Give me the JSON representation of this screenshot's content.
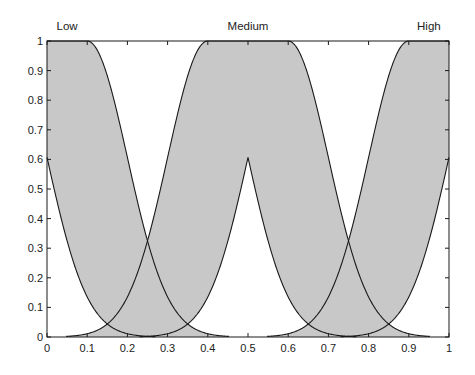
{
  "chart_data": {
    "type": "area",
    "title": "",
    "xlabel": "",
    "ylabel": "",
    "xlim": [
      0,
      1
    ],
    "ylim": [
      0,
      1
    ],
    "grid": false,
    "legend": null,
    "x_ticks": [
      "0",
      "0.1",
      "0.2",
      "0.3",
      "0.4",
      "0.5",
      "0.6",
      "0.7",
      "0.8",
      "0.9",
      "1"
    ],
    "y_ticks": [
      "0",
      "0.1",
      "0.2",
      "0.3",
      "0.4",
      "0.5",
      "0.6",
      "0.7",
      "0.8",
      "0.9",
      "1"
    ],
    "annotations": [
      {
        "text": "Low",
        "x": 0.05
      },
      {
        "text": "Medium",
        "x": 0.5
      },
      {
        "text": "High",
        "x": 0.95
      }
    ],
    "fill_color": "#c8c8c8",
    "line_color": "#1a1a1a",
    "series": [
      {
        "name": "Low",
        "sigma": 0.1,
        "mean_range": [
          -0.1,
          0.1
        ],
        "upper_peak": 1.0,
        "lower_peak_at_center": 0.61,
        "x": [
          0,
          0.05,
          0.1,
          0.15,
          0.2,
          0.25,
          0.3,
          0.35,
          0.4,
          0.45,
          0.5
        ],
        "upper": [
          1,
          1,
          1,
          0.88,
          0.61,
          0.32,
          0.14,
          0.04,
          0.01,
          0.0,
          0.0
        ],
        "lower": [
          0.61,
          0.32,
          0.14,
          0.04,
          0.01,
          0.0,
          0.0,
          0.0,
          0.0,
          0.0,
          0.0
        ]
      },
      {
        "name": "Medium",
        "sigma": 0.1,
        "mean_range": [
          0.4,
          0.6
        ],
        "upper_peak": 1.0,
        "lower_peak_at_center": 0.61,
        "x": [
          0.05,
          0.1,
          0.15,
          0.2,
          0.25,
          0.3,
          0.35,
          0.4,
          0.45,
          0.5,
          0.55,
          0.6,
          0.65,
          0.7,
          0.75,
          0.8,
          0.85,
          0.9,
          0.95
        ],
        "upper": [
          0.01,
          0.01,
          0.04,
          0.14,
          0.32,
          0.61,
          0.88,
          1,
          1,
          1,
          1,
          1,
          0.88,
          0.61,
          0.32,
          0.14,
          0.04,
          0.01,
          0.01
        ],
        "lower": [
          0.0,
          0.0,
          0.0,
          0.0,
          0.0,
          0.01,
          0.04,
          0.14,
          0.32,
          0.61,
          0.32,
          0.14,
          0.04,
          0.01,
          0.0,
          0.0,
          0.0,
          0.0,
          0.0
        ]
      },
      {
        "name": "High",
        "sigma": 0.1,
        "mean_range": [
          0.9,
          1.1
        ],
        "upper_peak": 1.0,
        "lower_peak_at_center": 0.61,
        "x": [
          0.5,
          0.55,
          0.6,
          0.65,
          0.7,
          0.75,
          0.8,
          0.85,
          0.9,
          0.95,
          1
        ],
        "upper": [
          0.0,
          0.0,
          0.01,
          0.04,
          0.14,
          0.32,
          0.61,
          0.88,
          1,
          1,
          1
        ],
        "lower": [
          0.0,
          0.0,
          0.0,
          0.0,
          0.0,
          0.0,
          0.01,
          0.04,
          0.14,
          0.32,
          0.61
        ]
      }
    ]
  },
  "layout": {
    "plot_left": 47,
    "plot_right": 449,
    "plot_top": 41,
    "plot_bottom": 337
  }
}
